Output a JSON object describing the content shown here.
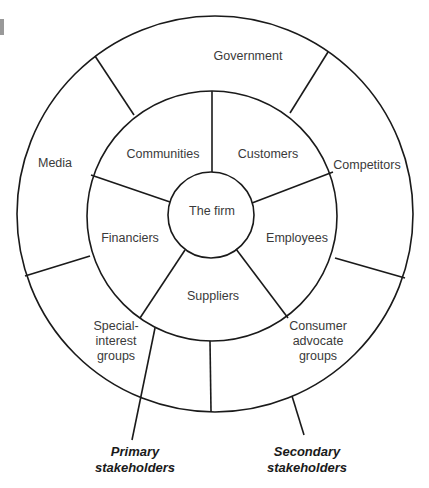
{
  "diagram": {
    "center": {
      "label": "The firm"
    },
    "primary_ring": {
      "segments": [
        {
          "label": "Customers"
        },
        {
          "label": "Employees"
        },
        {
          "label": "Suppliers"
        },
        {
          "label": "Financiers"
        },
        {
          "label": "Communities"
        }
      ]
    },
    "secondary_ring": {
      "segments": [
        {
          "label": "Government"
        },
        {
          "label": "Competitors"
        },
        {
          "label": "Consumer\nadvocate\ngroups"
        },
        {
          "label": "Special-\ninterest\ngroups"
        },
        {
          "label": "Media"
        }
      ]
    },
    "callouts": {
      "primary": "Primary\nstakeholders",
      "secondary": "Secondary\nstakeholders"
    },
    "colors": {
      "line": "#1a1a1a",
      "text": "#3a3a3a",
      "background": "#ffffff"
    }
  }
}
